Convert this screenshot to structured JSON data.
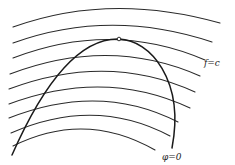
{
  "diagram": {
    "labels": {
      "level_curves": "f=c",
      "constraint_curve": "φ=0"
    },
    "colors": {
      "stroke": "#1a1a1a",
      "background": "#ffffff"
    },
    "level_curves": [
      {
        "start": [
          13,
          27
        ],
        "control": [
          110,
          -8
        ],
        "end": [
          220,
          23
        ]
      },
      {
        "start": [
          13,
          43
        ],
        "control": [
          110,
          8
        ],
        "end": [
          212,
          42
        ]
      },
      {
        "start": [
          13,
          58
        ],
        "control": [
          112,
          20
        ],
        "end": [
          205,
          60
        ]
      },
      {
        "start": [
          10,
          74
        ],
        "control": [
          110,
          36
        ],
        "end": [
          200,
          76
        ]
      },
      {
        "start": [
          9,
          89
        ],
        "control": [
          108,
          52
        ],
        "end": [
          195,
          92
        ]
      },
      {
        "start": [
          9,
          104
        ],
        "control": [
          105,
          68
        ],
        "end": [
          190,
          108
        ]
      },
      {
        "start": [
          9,
          118
        ],
        "control": [
          100,
          82
        ],
        "end": [
          178,
          122
        ]
      },
      {
        "start": [
          11,
          133
        ],
        "control": [
          95,
          96
        ],
        "end": [
          170,
          136
        ]
      },
      {
        "start": [
          13,
          146
        ],
        "control": [
          85,
          110
        ],
        "end": [
          155,
          150
        ]
      }
    ],
    "constraint_curve_path": "M 12 155 C 45 80, 80 38, 119 39 C 150 40, 185 80, 172 148",
    "tangent_point": {
      "x": 119,
      "y": 39,
      "r": 1.8
    },
    "label_positions": {
      "f_eq_c": {
        "x": 204,
        "y": 66
      },
      "phi_eq_0": {
        "x": 162,
        "y": 160
      }
    }
  }
}
